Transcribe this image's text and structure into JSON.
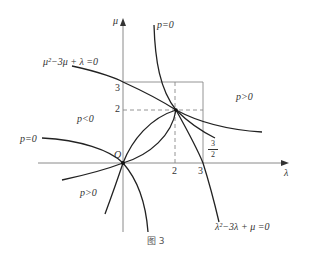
{
  "figure": {
    "caption": "图 3",
    "axes": {
      "x_label": "λ",
      "y_label": "μ",
      "origin_label": "O",
      "x_ticks": [
        "2",
        "3"
      ],
      "y_ticks": [
        "2",
        "3"
      ],
      "fraction_tick": {
        "numerator": "3",
        "denominator": "2"
      }
    },
    "curves": [
      {
        "name": "parabola-mu",
        "equation": "μ²−3μ + λ =0"
      },
      {
        "name": "parabola-lambda",
        "equation": "λ²−3λ + μ =0"
      },
      {
        "name": "hyperbola-p0-upper",
        "label": "p=0"
      },
      {
        "name": "hyperbola-p0-left",
        "label": "p=0"
      }
    ],
    "regions": {
      "upper_right": "p>0",
      "left": "p<0",
      "lower": "p>0"
    },
    "colors": {
      "curve": "#222222",
      "axis": "#888888",
      "text": "#333333"
    }
  }
}
